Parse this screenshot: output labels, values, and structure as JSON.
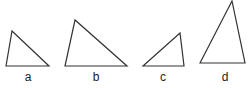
{
  "diagram": {
    "stroke_color": "#333333",
    "triangles": [
      {
        "label": "a",
        "points": "6,66 12,31 49,66",
        "label_x": 28,
        "label_y": 81
      },
      {
        "label": "b",
        "points": "65,66 75,20 127,66",
        "label_x": 96,
        "label_y": 81
      },
      {
        "label": "c",
        "points": "143,66 180,33 184,66",
        "label_x": 163,
        "label_y": 81
      },
      {
        "label": "d",
        "points": "200,63 232,1 245,63",
        "label_x": 225,
        "label_y": 81
      }
    ]
  }
}
